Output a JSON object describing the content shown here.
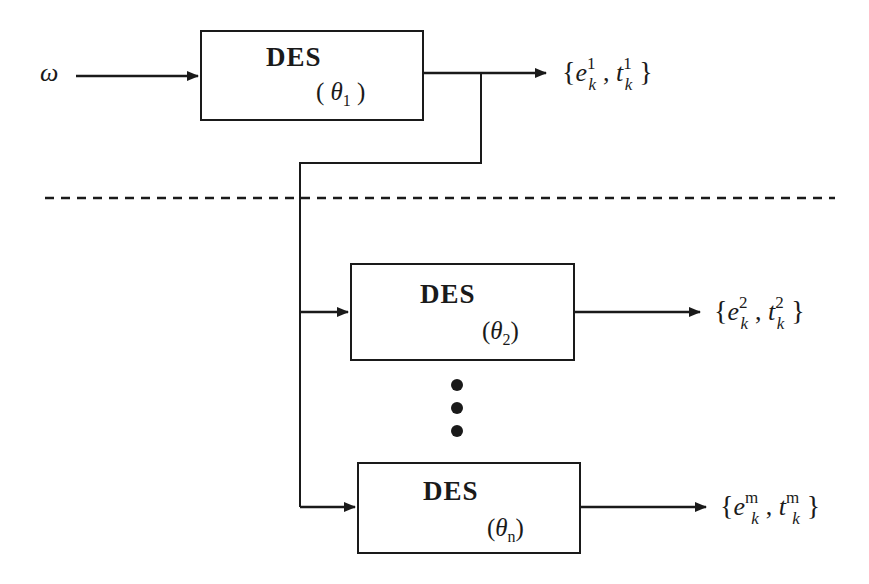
{
  "diagram": {
    "input": {
      "label": "ω"
    },
    "separator": {
      "style": "dashed"
    },
    "blocks": [
      {
        "id": "des1",
        "title": "DES",
        "param_symbol": "θ",
        "param_index": "1",
        "param_text": "(θ1)"
      },
      {
        "id": "des2",
        "title": "DES",
        "param_symbol": "θ",
        "param_index": "2",
        "param_text": "(θ2)"
      },
      {
        "id": "desn",
        "title": "DES",
        "param_symbol": "θ",
        "param_index": "n",
        "param_text": "(θn)"
      }
    ],
    "outputs": [
      {
        "event": "e",
        "time": "t",
        "sub": "k",
        "sup": "1",
        "text": "{e_k^1, t_k^1}"
      },
      {
        "event": "e",
        "time": "t",
        "sub": "k",
        "sup": "2",
        "text": "{e_k^2, t_k^2}"
      },
      {
        "event": "e",
        "time": "t",
        "sub": "k",
        "sup": "m",
        "text": "{e_k^m, t_k^m}"
      }
    ],
    "ellipsis": {
      "dots": 3
    },
    "colors": {
      "stroke": "#1a1a1a",
      "background": "#ffffff"
    }
  }
}
